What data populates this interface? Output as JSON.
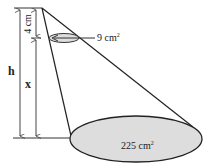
{
  "figure": {
    "small_area_label": "9 cm",
    "small_area_sup": "2",
    "large_area_label": "225 cm",
    "large_area_sup": "2",
    "dim_4cm": "4 cm",
    "dim_h": "h",
    "dim_x": "x"
  }
}
